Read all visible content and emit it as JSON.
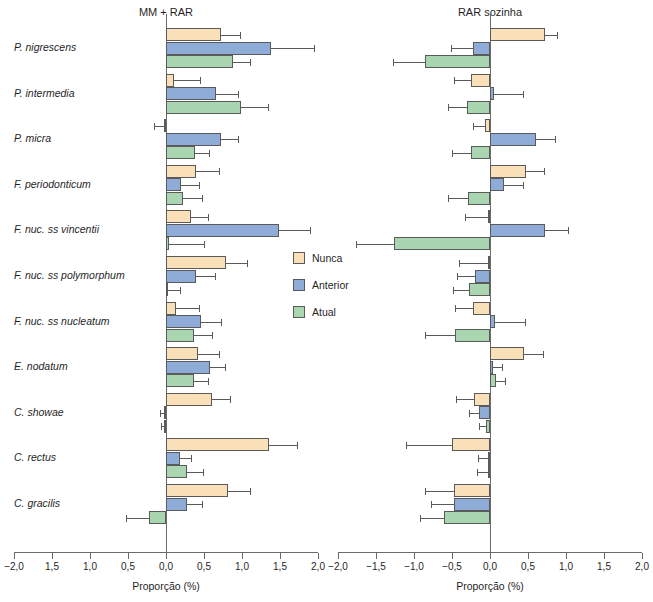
{
  "figure": {
    "panels": [
      {
        "id": "left",
        "title": "MM + RAR"
      },
      {
        "id": "right",
        "title": "RAR sozinha"
      }
    ],
    "legend": {
      "items": [
        {
          "label": "Nunca",
          "color": "#f9e0b8"
        },
        {
          "label": "Anterior",
          "color": "#8fabd8"
        },
        {
          "label": "Atual",
          "color": "#a9d5b0"
        }
      ]
    }
  },
  "chart_data": [
    {
      "type": "bar",
      "title": "MM + RAR",
      "orientation": "horizontal",
      "xlabel": "Proporção (%)",
      "ylabel": "",
      "xlim": [
        -2.0,
        2.0
      ],
      "xticks": [
        -2.0,
        -1.5,
        -1.0,
        -0.5,
        0.0,
        0.5,
        1.0,
        1.5,
        2.0
      ],
      "xticklabels": [
        "−2,0",
        "1,5",
        "1,0",
        "0,5",
        "0,0",
        "0,5",
        "1,0",
        "1,5",
        "2,0"
      ],
      "grid": false,
      "legend_position": "center",
      "categories": [
        "P. nigrescens",
        "P. intermedia",
        "P. micra",
        "F. periodonticum",
        "F. nuc. ss vincentii",
        "F. nuc. ss polymorphum",
        "F. nuc. ss nucleatum",
        "E. nodatum",
        "C. showae",
        "C. rectus",
        "C. gracilis"
      ],
      "series": [
        {
          "name": "Nunca",
          "color": "#f9e0b8",
          "values": [
            0.72,
            0.1,
            -0.03,
            0.4,
            0.33,
            0.79,
            0.13,
            0.42,
            0.6,
            1.36,
            0.81
          ],
          "errors": [
            0.25,
            0.35,
            0.13,
            0.3,
            0.22,
            0.28,
            0.3,
            0.28,
            0.24,
            0.36,
            0.3
          ]
        },
        {
          "name": "Anterior",
          "color": "#8fabd8",
          "values": [
            1.38,
            0.66,
            0.73,
            0.2,
            1.49,
            0.4,
            0.46,
            0.58,
            -0.03,
            0.19,
            0.28
          ],
          "errors": [
            0.57,
            0.29,
            0.22,
            0.23,
            0.41,
            0.24,
            0.27,
            0.19,
            0.05,
            0.14,
            0.2
          ]
        },
        {
          "name": "Atual",
          "color": "#a9d5b0",
          "values": [
            0.88,
            0.99,
            0.38,
            0.22,
            0.04,
            0.02,
            0.37,
            0.37,
            -0.02,
            0.27,
            -0.22
          ]
        }
      ],
      "atual_errors": [
        0.22,
        0.35,
        0.18,
        0.25,
        0.46,
        0.17,
        0.24,
        0.18,
        0.05,
        0.22,
        0.3
      ]
    },
    {
      "type": "bar",
      "title": "RAR sozinha",
      "orientation": "horizontal",
      "xlabel": "Proporção (%)",
      "ylabel": "",
      "xlim": [
        -2.0,
        2.0
      ],
      "xticks": [
        -2.0,
        -1.5,
        -1.0,
        -0.5,
        0.0,
        0.5,
        1.0,
        1.5,
        2.0
      ],
      "xticklabels": [
        "−2,0",
        "−1,5",
        "−1,0",
        "−0,5",
        "0,0",
        "0,5",
        "1,0",
        "1,5",
        "2,0"
      ],
      "grid": false,
      "legend_position": "none",
      "categories": [
        "P. nigrescens",
        "P. intermedia",
        "P. micra",
        "F. periodonticum",
        "F. nuc. ss vincentii",
        "F. nuc. ss polymorphum",
        "F. nuc. ss nucleatum",
        "E. nodatum",
        "C. showae",
        "C. rectus",
        "C. gracilis"
      ],
      "series": [
        {
          "name": "Nunca",
          "color": "#f9e0b8",
          "values": [
            0.72,
            -0.25,
            -0.07,
            0.47,
            -0.03,
            -0.03,
            -0.22,
            0.45,
            -0.21,
            -0.5,
            -0.47
          ],
          "errors": [
            0.16,
            0.23,
            0.15,
            0.24,
            0.3,
            0.38,
            0.24,
            0.25,
            0.24,
            0.6,
            0.38
          ]
        },
        {
          "name": "Anterior",
          "color": "#8fabd8",
          "values": [
            -0.22,
            0.05,
            0.61,
            0.19,
            0.73,
            -0.2,
            0.06,
            0.04,
            -0.14,
            -0.02,
            -0.47
          ],
          "errors": [
            0.29,
            0.38,
            0.25,
            0.25,
            0.3,
            0.24,
            0.4,
            0.12,
            0.13,
            0.14,
            0.3
          ]
        },
        {
          "name": "Atual",
          "color": "#a9d5b0",
          "values": [
            -0.85,
            -0.3,
            -0.25,
            -0.29,
            -1.26,
            -0.27,
            -0.46,
            0.08,
            -0.05,
            -0.02,
            -0.6
          ]
        }
      ],
      "atual_errors": [
        0.43,
        0.25,
        0.25,
        0.26,
        0.5,
        0.22,
        0.4,
        0.12,
        0.09,
        0.15,
        0.32
      ]
    }
  ]
}
